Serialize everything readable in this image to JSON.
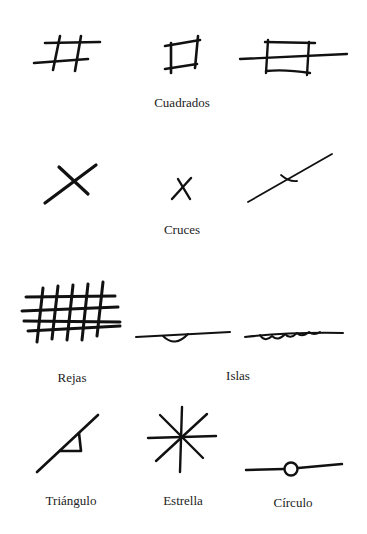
{
  "diagram": {
    "title": "",
    "stroke_color": "#111111",
    "background": "#ffffff",
    "groups": [
      {
        "id": "cuadrados",
        "label": "Cuadrados",
        "symbols": [
          "hash-grid",
          "square",
          "rectangle-crossed-by-line"
        ]
      },
      {
        "id": "cruces",
        "label": "Cruces",
        "symbols": [
          "large-cross",
          "small-cross",
          "line-with-small-cross"
        ]
      },
      {
        "id": "rejas",
        "label": "Rejas",
        "symbols": [
          "grid-lattice"
        ]
      },
      {
        "id": "islas",
        "label": "Islas",
        "symbols": [
          "line-with-single-loop",
          "line-with-multiple-loops"
        ]
      },
      {
        "id": "triangulo",
        "label": "Triángulo",
        "symbols": [
          "line-with-triangle"
        ]
      },
      {
        "id": "estrella",
        "label": "Estrella",
        "symbols": [
          "eight-point-star"
        ]
      },
      {
        "id": "circulo",
        "label": "Círculo",
        "symbols": [
          "line-with-circle"
        ]
      }
    ]
  }
}
